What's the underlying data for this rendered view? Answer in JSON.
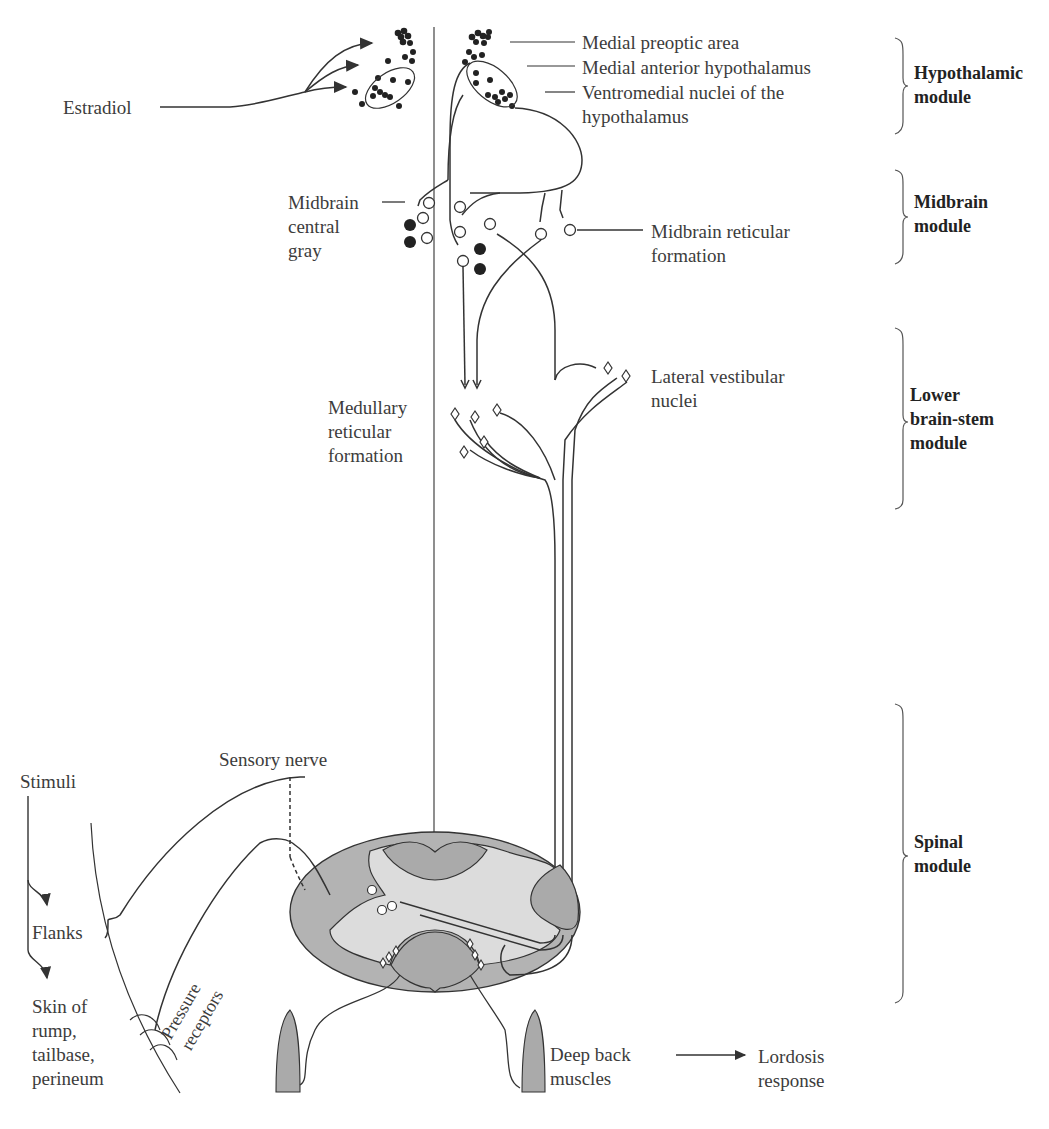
{
  "labels": {
    "estradiol": "Estradiol",
    "medial_preoptic_area": "Medial preoptic area",
    "medial_anterior_hypothalamus": "Medial anterior hypothalamus",
    "ventromedial_line1": "Ventromedial nuclei of the",
    "ventromedial_line2": "hypothalamus",
    "midbrain_central_gray_line1": "Midbrain",
    "midbrain_central_gray_line2": "central",
    "midbrain_central_gray_line3": "gray",
    "midbrain_reticular_line1": "Midbrain reticular",
    "midbrain_reticular_line2": "formation",
    "lateral_vestibular_line1": "Lateral vestibular",
    "lateral_vestibular_line2": "nuclei",
    "medullary_reticular_line1": "Medullary",
    "medullary_reticular_line2": "reticular",
    "medullary_reticular_line3": "formation",
    "sensory_nerve": "Sensory nerve",
    "stimuli": "Stimuli",
    "flanks": "Flanks",
    "skin_line1": "Skin of",
    "skin_line2": "rump,",
    "skin_line3": "tailbase,",
    "skin_line4": "perineum",
    "pressure": "Pressure",
    "receptors": "receptors",
    "deep_back_line1": "Deep back",
    "deep_back_line2": "muscles",
    "lordosis_line1": "Lordosis",
    "lordosis_line2": "response"
  },
  "modules": [
    {
      "line1": "Hypothalamic",
      "line2": "module"
    },
    {
      "line1": "Midbrain",
      "line2": "module"
    },
    {
      "line1": "Lower",
      "line2": "brain-stem",
      "line3": "module"
    },
    {
      "line1": "Spinal",
      "line2": "module"
    }
  ],
  "colors": {
    "line": "#333333",
    "gray_matter": "#a9a9a9",
    "white_matter": "#d6d6d6",
    "outer_cord": "#b4b4b4"
  }
}
